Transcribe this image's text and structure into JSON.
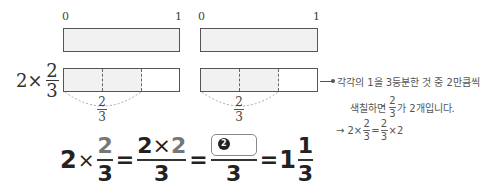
{
  "number_line": {
    "top_left": {
      "start_label": "0",
      "end_label": "1"
    },
    "top_right": {
      "start_label": "0",
      "end_label": "1"
    }
  },
  "expression_label": {
    "whole": "2",
    "times": "×",
    "numerator": "2",
    "denominator": "3"
  },
  "bars": {
    "left": {
      "shaded_fraction": {
        "numerator": "2",
        "denominator": "3"
      },
      "parts": 3,
      "shaded_parts": 2
    },
    "right": {
      "shaded_fraction": {
        "numerator": "2",
        "denominator": "3"
      },
      "parts": 3,
      "shaded_parts": 2
    }
  },
  "explanation": {
    "line1": "각각의 1을 3등분한 것 중 2만큼씩",
    "line2_prefix": "색칠하면",
    "line2_frac": {
      "numerator": "2",
      "denominator": "3"
    },
    "line2_suffix": "가 2개입니다.",
    "line3": {
      "arrow": "→",
      "a": "2×",
      "frac1": {
        "numerator": "2",
        "denominator": "3"
      },
      "eq": "=",
      "frac2": {
        "numerator": "2",
        "denominator": "3"
      },
      "b": "×2"
    }
  },
  "equation": {
    "term1_whole": "2",
    "times": "×",
    "term1_frac": {
      "numerator": "2",
      "denominator": "3"
    },
    "eq1": "=",
    "term2_frac": {
      "numerator_a": "2",
      "numerator_times": "×",
      "numerator_b": "2",
      "denominator": "3"
    },
    "eq2": "=",
    "blank_badge": "2",
    "term3_denominator": "3",
    "eq3": "=",
    "result_whole": "1",
    "result_frac": {
      "numerator": "1",
      "denominator": "3"
    }
  },
  "colors": {
    "shade": "#f1f1f1",
    "border": "#555555",
    "text": "#222222",
    "grey_digit": "#777777"
  }
}
